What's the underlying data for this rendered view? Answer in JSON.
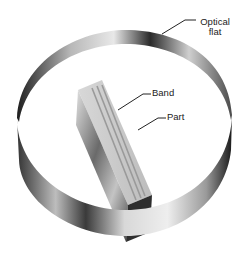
{
  "figure": {
    "labels": {
      "optical_flat_line1": "Optical",
      "optical_flat_line2": "flat",
      "band": "Band",
      "part": "Part"
    },
    "colors": {
      "background": "#ffffff",
      "label_text": "#222222",
      "ring_dark": "#2a2a2a",
      "ring_light": "#e6e6e6",
      "part_face": "#cfcfcf",
      "band_stripe": "#9a9a9a"
    }
  }
}
